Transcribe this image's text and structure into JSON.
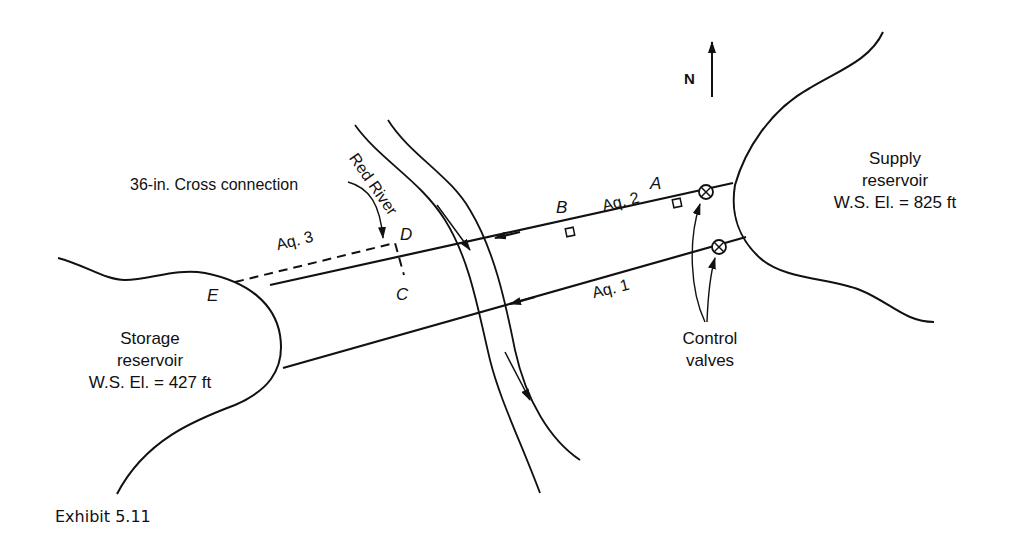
{
  "diagram": {
    "title": "Exhibit 5.11",
    "north_label": "N",
    "river_label": "Red River",
    "cross_connection_label": "36-in. Cross connection",
    "supply_reservoir": {
      "name_line1": "Supply",
      "name_line2": "reservoir",
      "elevation": "W.S. El. = 825 ft"
    },
    "storage_reservoir": {
      "name_line1": "Storage",
      "name_line2": "reservoir",
      "elevation": "W.S. El. = 427 ft"
    },
    "aqueducts": {
      "aq1": "Aq. 1",
      "aq2": "Aq. 2",
      "aq3": "Aq. 3"
    },
    "points": {
      "A": "A",
      "B": "B",
      "C": "C",
      "D": "D",
      "E": "E"
    },
    "valves_label_line1": "Control",
    "valves_label_line2": "valves"
  }
}
